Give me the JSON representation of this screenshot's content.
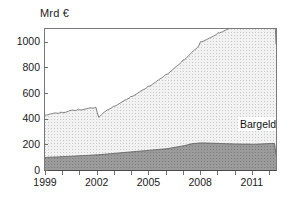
{
  "chart_data": {
    "type": "area",
    "stacked": true,
    "title": "",
    "subtitle": "",
    "xlabel": "",
    "ylabel": "Mrd €",
    "yunit": "Mrd €",
    "ylim": [
      0,
      1100
    ],
    "xlim": [
      1999.0,
      2012.4
    ],
    "grid": false,
    "legend_position": "in-plot-labels",
    "ytick_labels": [
      "0",
      "200",
      "400",
      "600",
      "800",
      "1000"
    ],
    "ytick_values": [
      0,
      200,
      400,
      600,
      800,
      1000
    ],
    "xtick_labels": [
      "1999",
      "2002",
      "2005",
      "2008",
      "2011"
    ],
    "xtick_values": [
      1999,
      2002,
      2005,
      2008,
      2011
    ],
    "colors": {
      "bargeldumlauf": "#e2e2e2",
      "mindestreserve": "#8f8f8f",
      "axis": "#4a4a4a",
      "line": "#6a6a6a",
      "text": "#1a1a1a",
      "background": "#ffffff"
    },
    "series": [
      {
        "name": "Mindestreserve",
        "fill": "#8f8f8f",
        "stack_order": 1,
        "values": [
          98,
          98,
          99,
          99,
          100,
          100,
          101,
          101,
          102,
          102,
          103,
          104,
          104,
          105,
          105,
          106,
          106,
          107,
          107,
          108,
          108,
          109,
          110,
          111,
          111,
          112,
          112,
          113,
          113,
          114,
          114,
          115,
          116,
          116,
          117,
          118,
          118,
          119,
          120,
          121,
          122,
          123,
          124,
          125,
          126,
          127,
          128,
          129,
          130,
          131,
          132,
          133,
          134,
          135,
          136,
          137,
          138,
          139,
          140,
          141,
          142,
          143,
          144,
          145,
          146,
          147,
          148,
          149,
          150,
          151,
          152,
          153,
          154,
          155,
          156,
          157,
          158,
          159,
          160,
          161,
          162,
          163,
          164,
          165,
          166,
          168,
          170,
          172,
          174,
          176,
          178,
          180,
          182,
          184,
          186,
          188,
          190,
          193,
          196,
          199,
          202,
          204,
          206,
          207,
          208,
          209,
          210,
          211,
          211,
          211,
          211,
          210,
          210,
          210,
          209,
          209,
          209,
          208,
          208,
          208,
          207,
          207,
          206,
          206,
          205,
          205,
          205,
          204,
          204,
          204,
          203,
          203,
          203,
          203,
          203,
          202,
          202,
          202,
          202,
          202,
          202,
          202,
          201,
          201,
          201,
          201,
          202,
          202,
          203,
          203,
          204,
          204,
          205,
          205,
          206,
          206,
          207,
          207,
          206,
          120
        ]
      },
      {
        "name": "Bargeldumlauf",
        "fill": "#e2e2e2",
        "stack_order": 2,
        "values": [
          330,
          331,
          332,
          336,
          338,
          340,
          342,
          344,
          342,
          340,
          342,
          348,
          344,
          343,
          345,
          348,
          352,
          356,
          358,
          360,
          357,
          355,
          357,
          364,
          358,
          357,
          358,
          360,
          363,
          366,
          368,
          370,
          368,
          366,
          368,
          372,
          330,
          292,
          300,
          312,
          322,
          330,
          338,
          344,
          348,
          352,
          358,
          368,
          368,
          372,
          378,
          384,
          390,
          396,
          402,
          408,
          412,
          416,
          422,
          432,
          432,
          436,
          442,
          448,
          455,
          462,
          468,
          474,
          478,
          483,
          490,
          500,
          500,
          505,
          512,
          520,
          527,
          535,
          542,
          549,
          554,
          560,
          568,
          580,
          580,
          586,
          594,
          602,
          610,
          618,
          626,
          634,
          640,
          647,
          656,
          670,
          670,
          677,
          686,
          695,
          704,
          713,
          722,
          731,
          738,
          748,
          762,
          790,
          790,
          794,
          800,
          806,
          812,
          818,
          824,
          830,
          836,
          842,
          850,
          862,
          862,
          866,
          872,
          878,
          884,
          890,
          896,
          902,
          908,
          914,
          922,
          936,
          936,
          940,
          946,
          952,
          958,
          964,
          970,
          976,
          982,
          988,
          996,
          1012,
          1012,
          1016,
          1022,
          1028,
          1034,
          1040,
          1046,
          1052,
          1058,
          1064,
          1072,
          1088,
          1088,
          1082,
          1060,
          860
        ]
      }
    ],
    "annotations": [
      {
        "name": "Bargeldumlauf",
        "x": 2009.4,
        "y": 640
      },
      {
        "name": "Mindestreserve",
        "x": 2009.2,
        "y": 150
      }
    ]
  },
  "labels": {
    "axis_unit": "Mrd €",
    "bargeldumlauf": "Bargeldumlauf",
    "mindestreserve": "Mindestreserve"
  }
}
